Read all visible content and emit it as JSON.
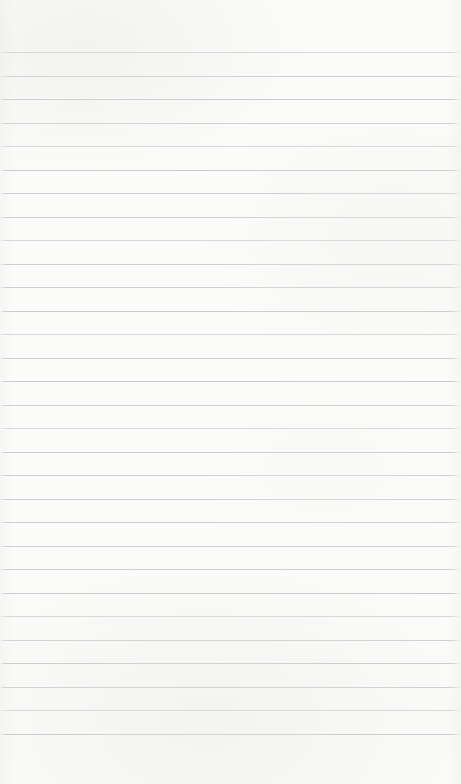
{
  "paper": {
    "description": "Blank ruled notebook page with no text or marks",
    "background_color": "#fbfbfa",
    "content_text": "",
    "ruled_lines": {
      "count": 30,
      "first_line_top_px": 52,
      "spacing_px": 23.5,
      "thickness_px": 1,
      "color": "#c7c9c8"
    }
  }
}
